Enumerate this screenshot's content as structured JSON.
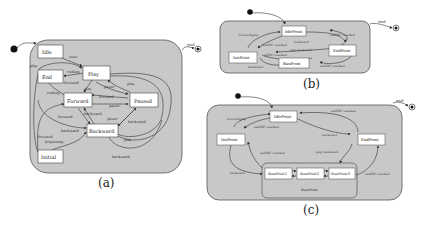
{
  "colors": {
    "container_fill": "#c8c8c8",
    "container_stroke": "#555555",
    "state_fill": "#ffffff",
    "state_stroke": "#444444",
    "edge": "#333333",
    "label": "#333333"
  },
  "diagram_a": {
    "caption": "(a)",
    "end_label": "end",
    "states": {
      "idle": "Idle",
      "end": "End",
      "play": "Play",
      "forward": "Forward",
      "paused": "Paused",
      "backward": "Backward",
      "initial": "Initial"
    },
    "edge_labels": {
      "start": "start",
      "play_top": "play",
      "ending": "ending",
      "forward1": "forward",
      "play2": "play",
      "ending2": "ending",
      "pause1": "pause",
      "play3": "play",
      "forward2": "forward",
      "pause2": "pause",
      "backward1": "backward",
      "forward3": "forward",
      "pause3": "pause",
      "backward2": "backward",
      "backward3": "backward",
      "play4": "play",
      "forward_beginning_1": "forward",
      "forward_beginning_2": "beginning",
      "backward4": "backward"
    }
  },
  "diagram_b": {
    "caption": "(b)",
    "end_label": "end",
    "states": {
      "idle": "IdlePoint",
      "init": "InitPoint",
      "end": "EndPoint",
      "run": "RunPoint"
    },
    "edge_labels": {
      "forward_play": "forward/play",
      "endOfC_reached_1": "endOfC reached",
      "endOfC_reached_2": "endOfC reached",
      "backward": "backward",
      "play_backward": "play backward",
      "endOfC_reached_3": "endOfC reached",
      "endOfC_reached_4": "endOfC reached",
      "backward2": "backward"
    }
  },
  "diagram_c": {
    "caption": "(c)",
    "end_label": "end",
    "states": {
      "idle": "IdlePoint",
      "init": "InitPoint",
      "end": "EndPoint",
      "run_container": "RunPoint",
      "run1": "RunPoint1",
      "run2": "RunPoint2",
      "run3": "RunPoint3"
    },
    "edge_labels": {
      "forward_play": "forward/play",
      "endOfC_reached_1": "endOfC reached",
      "endOfC_reached_2": "endOfC reached",
      "backward": "backward",
      "endOfC_reached_3": "endOfC reached",
      "play_backward": "play backward",
      "backward2": "backward",
      "endOfC_reached_4": "endOfC reached"
    }
  }
}
